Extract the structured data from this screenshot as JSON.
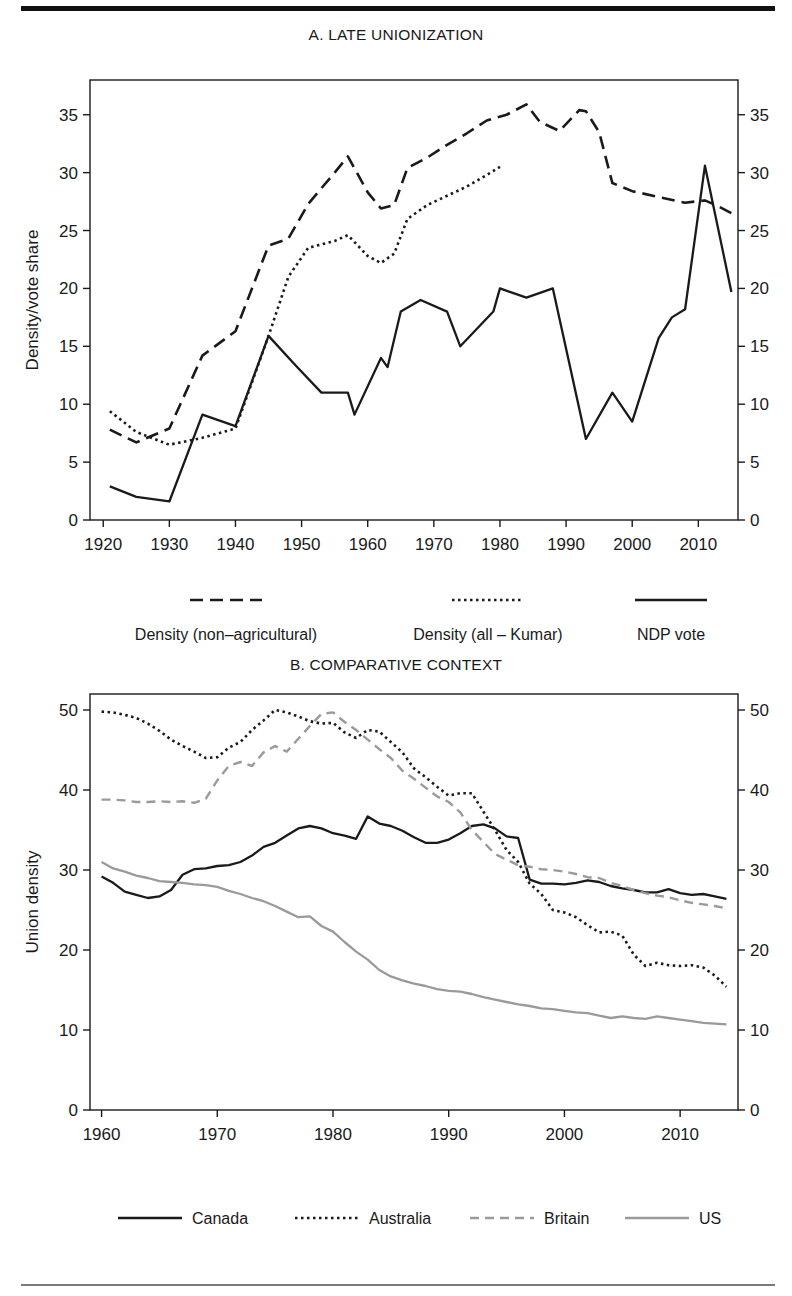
{
  "figure": {
    "top_rule_color": "#111111",
    "bottom_rule_color": "#7a7a7a",
    "background": "#ffffff"
  },
  "panel_a": {
    "title": "A. LATE UNIONIZATION",
    "ylabel": "Density/vote share",
    "legend": [
      {
        "label": "Density (non–agricultural)",
        "style": "long-dash",
        "color": "#1a1a1a"
      },
      {
        "label": "Density (all – Kumar)",
        "style": "dotted",
        "color": "#1a1a1a"
      },
      {
        "label": "NDP vote",
        "style": "solid",
        "color": "#1a1a1a"
      }
    ]
  },
  "panel_b": {
    "title": "B. COMPARATIVE CONTEXT",
    "ylabel": "Union density",
    "legend": [
      {
        "label": "Canada",
        "style": "solid",
        "color": "#1a1a1a"
      },
      {
        "label": "Australia",
        "style": "dotted",
        "color": "#1a1a1a"
      },
      {
        "label": "Britain",
        "style": "dashed",
        "color": "#9a9a9a"
      },
      {
        "label": "US",
        "style": "solid",
        "color": "#9a9a9a"
      }
    ]
  },
  "chart_data": [
    {
      "id": "panel-a",
      "type": "line",
      "title": "A. LATE UNIONIZATION",
      "xlabel": "",
      "ylabel": "Density/vote share",
      "xlim": [
        1918,
        2016
      ],
      "ylim": [
        0,
        38
      ],
      "xticks": [
        1920,
        1930,
        1940,
        1950,
        1960,
        1970,
        1980,
        1990,
        2000,
        2010
      ],
      "yticks": [
        0,
        5,
        10,
        15,
        20,
        25,
        30,
        35
      ],
      "grid": false,
      "legend_position": "below",
      "dual_y_axis": true,
      "series": [
        {
          "name": "Density (non–agricultural)",
          "style": "long-dash",
          "color": "#1a1a1a",
          "x": [
            1921,
            1925,
            1930,
            1935,
            1940,
            1945,
            1948,
            1951,
            1955,
            1957,
            1960,
            1962,
            1964,
            1966,
            1969,
            1972,
            1975,
            1978,
            1981,
            1984,
            1986,
            1989,
            1992,
            1993,
            1995,
            1997,
            2000,
            2004,
            2008,
            2011,
            2013,
            2015
          ],
          "y": [
            7.8,
            6.7,
            7.9,
            14.2,
            16.3,
            23.7,
            24.3,
            27.3,
            30.0,
            31.4,
            28.3,
            26.9,
            27.2,
            30.4,
            31.3,
            32.4,
            33.4,
            34.5,
            35.0,
            35.9,
            34.4,
            33.6,
            35.4,
            35.3,
            33.5,
            29.1,
            28.4,
            27.9,
            27.4,
            27.6,
            27.1,
            26.5
          ]
        },
        {
          "name": "Density (all – Kumar)",
          "style": "dotted",
          "color": "#1a1a1a",
          "x": [
            1921,
            1925,
            1930,
            1935,
            1940,
            1945,
            1948,
            1951,
            1955,
            1957,
            1960,
            1962,
            1964,
            1966,
            1969,
            1972,
            1975,
            1978,
            1980
          ],
          "y": [
            9.4,
            7.6,
            6.5,
            7.1,
            7.9,
            15.9,
            21.0,
            23.5,
            24.1,
            24.6,
            22.8,
            22.2,
            23.0,
            26.0,
            27.2,
            28.0,
            28.8,
            29.8,
            30.5
          ]
        },
        {
          "name": "NDP vote",
          "style": "solid",
          "color": "#1a1a1a",
          "x": [
            1921,
            1925,
            1930,
            1935,
            1940,
            1945,
            1949,
            1953,
            1957,
            1958,
            1962,
            1963,
            1965,
            1968,
            1972,
            1974,
            1979,
            1980,
            1984,
            1988,
            1993,
            1997,
            2000,
            2004,
            2006,
            2008,
            2011,
            2015
          ],
          "y": [
            2.9,
            2.0,
            1.6,
            9.1,
            8.1,
            15.9,
            13.4,
            11.0,
            11.0,
            9.1,
            14.0,
            13.2,
            18.0,
            19.0,
            18.0,
            15.0,
            18.0,
            20.0,
            19.2,
            20.0,
            7.0,
            11.0,
            8.5,
            15.7,
            17.5,
            18.2,
            30.6,
            19.7
          ]
        }
      ]
    },
    {
      "id": "panel-b",
      "type": "line",
      "title": "B. COMPARATIVE CONTEXT",
      "xlabel": "",
      "ylabel": "Union density",
      "xlim": [
        1959,
        2015
      ],
      "ylim": [
        0,
        52
      ],
      "xticks": [
        1960,
        1970,
        1980,
        1990,
        2000,
        2010
      ],
      "yticks": [
        0,
        10,
        20,
        30,
        40,
        50
      ],
      "grid": false,
      "legend_position": "below",
      "dual_y_axis": true,
      "series": [
        {
          "name": "Canada",
          "style": "solid",
          "color": "#1a1a1a",
          "x": [
            1960,
            1961,
            1962,
            1963,
            1964,
            1965,
            1966,
            1967,
            1968,
            1969,
            1970,
            1971,
            1972,
            1973,
            1974,
            1975,
            1976,
            1977,
            1978,
            1979,
            1980,
            1981,
            1982,
            1983,
            1984,
            1985,
            1986,
            1987,
            1988,
            1989,
            1990,
            1991,
            1992,
            1993,
            1994,
            1995,
            1996,
            1997,
            1998,
            1999,
            2000,
            2001,
            2002,
            2003,
            2004,
            2005,
            2006,
            2007,
            2008,
            2009,
            2010,
            2011,
            2012,
            2013,
            2014
          ],
          "y": [
            29.2,
            28.4,
            27.3,
            26.9,
            26.5,
            26.7,
            27.5,
            29.4,
            30.1,
            30.2,
            30.5,
            30.6,
            31.0,
            31.8,
            32.9,
            33.4,
            34.3,
            35.2,
            35.5,
            35.2,
            34.6,
            34.3,
            33.9,
            36.7,
            35.8,
            35.5,
            34.9,
            34.1,
            33.4,
            33.4,
            33.8,
            34.6,
            35.5,
            35.7,
            35.2,
            34.2,
            34.0,
            28.8,
            28.3,
            28.3,
            28.2,
            28.4,
            28.7,
            28.5,
            28.0,
            27.7,
            27.5,
            27.2,
            27.2,
            27.6,
            27.1,
            26.9,
            27.0,
            26.7,
            26.4
          ]
        },
        {
          "name": "Australia",
          "style": "dotted",
          "color": "#1a1a1a",
          "x": [
            1960,
            1961,
            1962,
            1963,
            1964,
            1965,
            1966,
            1967,
            1968,
            1969,
            1970,
            1971,
            1972,
            1973,
            1974,
            1975,
            1976,
            1977,
            1978,
            1979,
            1980,
            1981,
            1982,
            1983,
            1984,
            1985,
            1986,
            1987,
            1988,
            1989,
            1990,
            1991,
            1992,
            1993,
            1994,
            1995,
            1996,
            1997,
            1998,
            1999,
            2000,
            2001,
            2002,
            2003,
            2004,
            2005,
            2006,
            2007,
            2008,
            2009,
            2010,
            2011,
            2012,
            2013,
            2014
          ],
          "y": [
            49.8,
            49.7,
            49.4,
            49.0,
            48.3,
            47.4,
            46.3,
            45.5,
            44.8,
            44.0,
            44.1,
            45.3,
            46.0,
            47.5,
            48.7,
            50.0,
            49.7,
            49.2,
            48.6,
            48.3,
            48.4,
            47.2,
            46.5,
            47.5,
            47.3,
            46.0,
            44.7,
            42.7,
            41.6,
            40.4,
            39.3,
            39.6,
            39.6,
            37.3,
            35.0,
            32.5,
            31.0,
            28.3,
            27.0,
            25.0,
            24.7,
            24.1,
            23.1,
            22.2,
            22.3,
            21.8,
            19.4,
            18.0,
            18.4,
            18.1,
            18.0,
            18.1,
            17.8,
            16.8,
            15.4
          ]
        },
        {
          "name": "Britain",
          "style": "dashed",
          "color": "#9a9a9a",
          "x": [
            1960,
            1961,
            1962,
            1963,
            1964,
            1965,
            1966,
            1967,
            1968,
            1969,
            1970,
            1971,
            1972,
            1973,
            1974,
            1975,
            1976,
            1977,
            1978,
            1979,
            1980,
            1981,
            1982,
            1983,
            1984,
            1985,
            1986,
            1987,
            1988,
            1989,
            1990,
            1991,
            1992,
            1993,
            1994,
            1995,
            1996,
            1997,
            1998,
            1999,
            2000,
            2001,
            2002,
            2003,
            2004,
            2005,
            2006,
            2007,
            2008,
            2009,
            2010,
            2011,
            2012,
            2013,
            2014
          ],
          "y": [
            38.8,
            38.8,
            38.7,
            38.5,
            38.5,
            38.6,
            38.5,
            38.6,
            38.4,
            38.9,
            41.2,
            43.0,
            43.5,
            43.0,
            44.7,
            45.5,
            44.8,
            46.4,
            48.0,
            49.5,
            49.7,
            48.5,
            47.5,
            46.3,
            45.1,
            44.0,
            42.4,
            41.4,
            40.3,
            39.2,
            38.5,
            37.2,
            35.0,
            33.5,
            32.0,
            31.3,
            30.6,
            30.4,
            30.1,
            30.0,
            29.8,
            29.5,
            29.1,
            29.0,
            28.4,
            28.0,
            27.5,
            27.1,
            26.8,
            26.6,
            26.2,
            25.9,
            25.7,
            25.5,
            25.2
          ]
        },
        {
          "name": "US",
          "style": "solid",
          "color": "#9a9a9a",
          "x": [
            1960,
            1961,
            1962,
            1963,
            1964,
            1965,
            1966,
            1967,
            1968,
            1969,
            1970,
            1971,
            1972,
            1973,
            1974,
            1975,
            1976,
            1977,
            1978,
            1979,
            1980,
            1981,
            1982,
            1983,
            1984,
            1985,
            1986,
            1987,
            1988,
            1989,
            1990,
            1991,
            1992,
            1993,
            1994,
            1995,
            1996,
            1997,
            1998,
            1999,
            2000,
            2001,
            2002,
            2003,
            2004,
            2005,
            2006,
            2007,
            2008,
            2009,
            2010,
            2011,
            2012,
            2013,
            2014
          ],
          "y": [
            31.0,
            30.2,
            29.8,
            29.3,
            29.0,
            28.6,
            28.5,
            28.4,
            28.2,
            28.1,
            27.9,
            27.4,
            27.0,
            26.5,
            26.1,
            25.5,
            24.8,
            24.1,
            24.2,
            23.0,
            22.3,
            21.0,
            19.8,
            18.8,
            17.5,
            16.7,
            16.2,
            15.8,
            15.5,
            15.1,
            14.9,
            14.8,
            14.5,
            14.1,
            13.8,
            13.5,
            13.2,
            13.0,
            12.7,
            12.6,
            12.4,
            12.2,
            12.1,
            11.8,
            11.5,
            11.7,
            11.5,
            11.4,
            11.7,
            11.5,
            11.3,
            11.1,
            10.9,
            10.8,
            10.7
          ]
        }
      ]
    }
  ]
}
